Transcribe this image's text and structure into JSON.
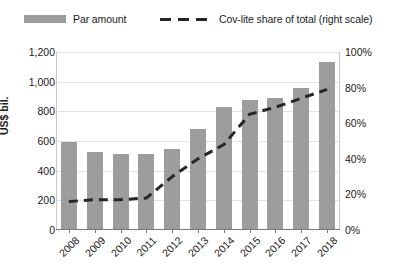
{
  "legend": {
    "bar_label": "Par amount",
    "line_label": "Cov-lite share of total (right scale)"
  },
  "axes": {
    "y_left_title": "US$ bil.",
    "y_left_ticks": [
      "1,200",
      "1,000",
      "800",
      "600",
      "400",
      "200",
      "0"
    ],
    "y_right_ticks": [
      "100%",
      "80%",
      "60%",
      "40%",
      "20%",
      "0%"
    ]
  },
  "chart_data": {
    "type": "bar",
    "title": "",
    "xlabel": "",
    "ylabel": "US$ bil.",
    "y2label": "Cov-lite share of total",
    "categories": [
      "2008",
      "2009",
      "2010",
      "2011",
      "2012",
      "2013",
      "2014",
      "2015",
      "2016",
      "2017",
      "2018"
    ],
    "series": [
      {
        "name": "Par amount",
        "type": "bar",
        "axis": "left",
        "color": "#9d9d9d",
        "unit": "US$ bil.",
        "values": [
          590,
          525,
          510,
          515,
          545,
          680,
          830,
          875,
          890,
          955,
          1130
        ]
      },
      {
        "name": "Cov-lite share of total (right scale)",
        "type": "line",
        "axis": "right",
        "color": "#262626",
        "style": "dashed",
        "unit": "%",
        "values": [
          16,
          17,
          17,
          18,
          30,
          40,
          48,
          65,
          69,
          74,
          79
        ]
      }
    ],
    "ylim": [
      0,
      1200
    ],
    "y2lim": [
      0,
      100
    ],
    "grid": true,
    "legend_position": "top"
  }
}
